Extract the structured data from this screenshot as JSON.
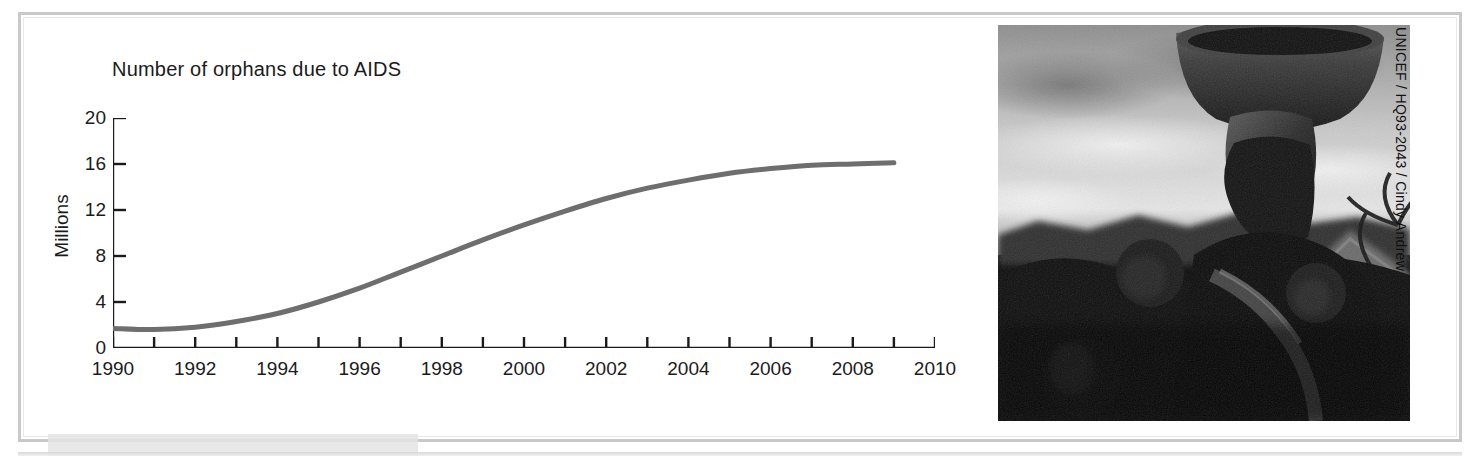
{
  "chart_data": {
    "type": "line",
    "title": "Number of orphans due to AIDS",
    "xlabel": "",
    "ylabel": "Millions",
    "xlim": [
      1990,
      2010
    ],
    "ylim": [
      0,
      20
    ],
    "ytick_values": [
      0,
      4,
      8,
      12,
      16,
      20
    ],
    "ytick_labels": [
      "0",
      "4",
      "8",
      "12",
      "16",
      "20"
    ],
    "xtick_values": [
      1990,
      1991,
      1992,
      1993,
      1994,
      1995,
      1996,
      1997,
      1998,
      1999,
      2000,
      2001,
      2002,
      2003,
      2004,
      2005,
      2006,
      2007,
      2008,
      2009,
      2010
    ],
    "xtick_labels": [
      "1990",
      "",
      "1992",
      "",
      "1994",
      "",
      "1996",
      "",
      "1998",
      "",
      "2000",
      "",
      "2002",
      "",
      "2004",
      "",
      "2006",
      "",
      "2008",
      "",
      "2010"
    ],
    "grid": false,
    "legend": false,
    "series": [
      {
        "name": "Orphans due to AIDS",
        "color": "#6e6e6e",
        "x": [
          1990,
          1991,
          1992,
          1993,
          1994,
          1995,
          1996,
          1997,
          1998,
          1999,
          2000,
          2001,
          2002,
          2003,
          2004,
          2005,
          2006,
          2007,
          2008,
          2009
        ],
        "values": [
          1.7,
          1.6,
          1.8,
          2.3,
          3.0,
          4.0,
          5.2,
          6.6,
          8.0,
          9.4,
          10.7,
          11.9,
          13.0,
          13.9,
          14.6,
          15.2,
          15.6,
          15.9,
          16.0,
          16.1
        ]
      }
    ]
  },
  "chart": {
    "title": "Number of orphans due to AIDS",
    "y_axis_label": "Millions"
  },
  "photo": {
    "alt_description": "Black and white photograph of a woman carrying a basin on her head with children",
    "credit": "UNICEF / HQ93-2043 / Cindy Andrew"
  },
  "colors": {
    "curve": "#6e6e6e",
    "axis": "#1b1b1b",
    "text": "#1b1b1b",
    "page_border": "#c9c9c9",
    "background": "#ffffff"
  }
}
